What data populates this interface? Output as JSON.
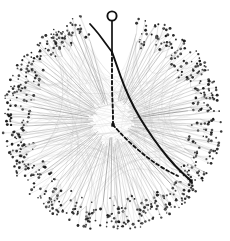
{
  "figure": {
    "kind": "radial-hierarchical-edge-bundling",
    "title": "Radial hierarchy graph with bundled cross-links",
    "caption": "",
    "width": 230,
    "height": 241,
    "background_color": "#ffffff",
    "has_frame": false,
    "has_axes": false,
    "has_legend": false,
    "has_text_labels": false
  },
  "chart_data": {
    "type": "scatter",
    "title": "Radial hierarchy graph with bundled cross-links",
    "xlabel": "",
    "ylabel": "",
    "grid": false,
    "legend_position": "none",
    "xlim": [
      0,
      230
    ],
    "ylim": [
      0,
      241
    ]
  },
  "colors": {
    "background": "#ffffff",
    "leaf_node": "#1a1a1a",
    "spoke_edge": "#8a8a8a",
    "spoke_edge_light": "#b4b4b4",
    "chord_link": "#cfcfcf",
    "chord_link_faint": "#e2e2e2",
    "highlight_path": "#111111",
    "root_stroke": "#111111"
  },
  "geometry": {
    "center_x": 112,
    "center_y": 121,
    "outer_radius": 106,
    "leaf_ring_inner": 74,
    "leaf_ring_outer": 108,
    "hub_radius": 16,
    "gap_start_deg": -104,
    "gap_end_deg": -76
  },
  "root": {
    "label": "root",
    "cx": 112,
    "cy": 16,
    "r": 4.6,
    "stroke_width": 1.9,
    "fill": "none"
  },
  "stem": {
    "from_x": 112,
    "from_y": 20.6,
    "to_x": 112,
    "to_y": 52,
    "stroke_width": 1.7
  },
  "fork": {
    "x": 112,
    "y": 52,
    "branches": 2
  },
  "highlight_paths": [
    {
      "name": "solid-branch-upper-left",
      "style": "solid",
      "stroke_width": 1.8,
      "points": "112,52 106,44 98,33 90,24"
    },
    {
      "name": "solid-branch-lower-right",
      "style": "solid",
      "stroke_width": 2.0,
      "points": "112,52 117,66 124,86 134,108 146,128 160,148 175,166 190,180"
    },
    {
      "name": "dashed-branch-descending",
      "style": "dashed",
      "dash_pattern": "3.2 2.6",
      "stroke_width": 1.9,
      "points": "112,52 112,70 112,92 113,112 113,125"
    },
    {
      "name": "dashed-branch-lower-right",
      "style": "dashed",
      "dash_pattern": "3.2 2.6",
      "stroke_width": 1.8,
      "points": "113,125 124,137 138,150 152,161 166,170 178,176"
    }
  ],
  "highlight_markers": [
    {
      "name": "dashed-waypoint-node",
      "cx": 113,
      "cy": 125,
      "size": 3.4
    },
    {
      "name": "solid-path-endpoint",
      "cx": 191,
      "cy": 181,
      "size": 3.4
    }
  ],
  "counts": {
    "spokes": 132,
    "leaf_nodes_approx": 690,
    "chord_links": 150,
    "highlighted_paths": 4
  },
  "render": {
    "spoke_seed": 20240517,
    "leaf_seed": 99137,
    "chord_seed": 4471,
    "leaves_per_spoke_min": 3,
    "leaves_per_spoke_max": 8,
    "leaf_dot_r_min": 0.75,
    "leaf_dot_r_max": 1.5
  }
}
